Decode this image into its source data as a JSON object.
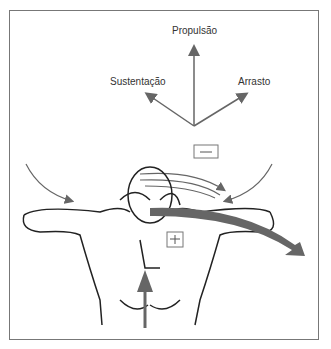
{
  "diagram": {
    "labels": {
      "propulsion": "Propulsão",
      "lift": "Sustentação",
      "drag": "Arrasto"
    },
    "pressure_boxes": {
      "low": "—",
      "high": "+"
    },
    "colors": {
      "arrow": "#666666",
      "outline": "#222222",
      "frame": "#777777"
    }
  }
}
